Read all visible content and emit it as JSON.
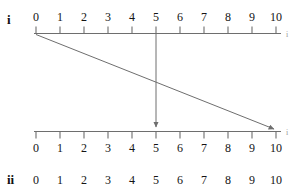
{
  "diagram": {
    "type": "number-line-mapping",
    "title": "",
    "axis_color": "#6e6e6e",
    "arrow_color": "#6e6e6e",
    "text_color": "#141414",
    "unit_px": 24,
    "origin_x_px": 36,
    "top_axis_y_px": 33,
    "bottom_axis_y_px": 131,
    "rows": [
      {
        "id": "top",
        "label": "i",
        "label_x_px": 7,
        "label_y_px": 13,
        "numbers_side": "above",
        "ticks_side": "below",
        "ticks": [
          0,
          1,
          2,
          3,
          4,
          5,
          6,
          7,
          8,
          9,
          10
        ],
        "tick_labels": [
          "0",
          "1",
          "2",
          "3",
          "4",
          "5",
          "6",
          "7",
          "8",
          "9",
          "10"
        ],
        "edge_mark": "i"
      },
      {
        "id": "bottom",
        "label": "",
        "numbers_side": "below",
        "ticks_side": "below",
        "ticks": [
          0,
          1,
          2,
          3,
          4,
          5,
          6,
          7,
          8,
          9,
          10
        ],
        "tick_labels": [
          "0",
          "1",
          "2",
          "3",
          "4",
          "5",
          "6",
          "7",
          "8",
          "9",
          "10"
        ],
        "edge_mark": "i"
      },
      {
        "id": "third-clipped",
        "label": "ii",
        "label_x_px": 7,
        "label_y_px": 176,
        "numbers_side": "below",
        "clipped": true,
        "ticks": [
          0,
          1,
          2,
          3,
          4,
          5,
          6,
          7,
          8,
          9,
          10
        ],
        "tick_labels": [
          "0",
          "1",
          "2",
          "3",
          "4",
          "5",
          "6",
          "7",
          "8",
          "9",
          "10"
        ]
      }
    ],
    "arrows": [
      {
        "id": "arrow-0-to-10",
        "from_value": 0,
        "to_value": 10,
        "from_row": "top",
        "to_row": "bottom",
        "has_head": true
      },
      {
        "id": "arrow-5-to-5",
        "from_value": 5,
        "to_value": 5,
        "from_row": "top",
        "to_row": "bottom",
        "has_head": true
      }
    ]
  }
}
